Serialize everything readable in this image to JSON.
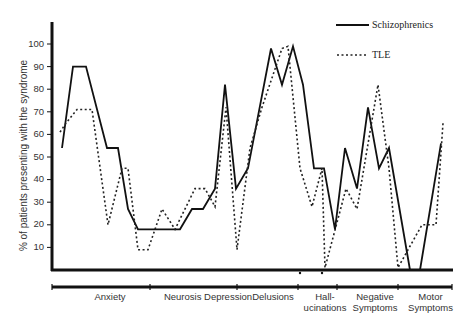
{
  "chart_data": {
    "type": "line",
    "title": "",
    "xlabel": "",
    "ylabel": "% of patients presenting with the syndrome",
    "ylim": [
      0,
      105
    ],
    "yticks": [
      10,
      20,
      30,
      40,
      50,
      60,
      70,
      80,
      90,
      100
    ],
    "grid": false,
    "legend_position": "top-right",
    "categories": [
      "Anxiety",
      "Neurosis Depression",
      "Delusions",
      "Hall-\nucinations",
      "Negative Symptoms",
      "Motor Symptoms"
    ],
    "series": [
      {
        "name": "Schizophrenics",
        "style": "solid",
        "points": [
          [
            62,
            54
          ],
          [
            73,
            90
          ],
          [
            86,
            90
          ],
          [
            107,
            54
          ],
          [
            118,
            54
          ],
          [
            128,
            27
          ],
          [
            138,
            18
          ],
          [
            180,
            18
          ],
          [
            192,
            27
          ],
          [
            203,
            27
          ],
          [
            215,
            36
          ],
          [
            225,
            82
          ],
          [
            236,
            36
          ],
          [
            248,
            45
          ],
          [
            271,
            98
          ],
          [
            282,
            82
          ],
          [
            293,
            99
          ],
          [
            303,
            82
          ],
          [
            314,
            45
          ],
          [
            324,
            45
          ],
          [
            335,
            18
          ],
          [
            345,
            54
          ],
          [
            357,
            36
          ],
          [
            368,
            72
          ],
          [
            379,
            45
          ],
          [
            389,
            54
          ],
          [
            410,
            0
          ],
          [
            420,
            0
          ],
          [
            441,
            56
          ]
        ]
      },
      {
        "name": "TLE",
        "style": "dotted",
        "points": [
          [
            60,
            61
          ],
          [
            66,
            65
          ],
          [
            77,
            71
          ],
          [
            92,
            71
          ],
          [
            108,
            20
          ],
          [
            122,
            45
          ],
          [
            128,
            45
          ],
          [
            138,
            9
          ],
          [
            148,
            9
          ],
          [
            162,
            27
          ],
          [
            175,
            18
          ],
          [
            195,
            36
          ],
          [
            205,
            36
          ],
          [
            215,
            28
          ],
          [
            226,
            72
          ],
          [
            237,
            9
          ],
          [
            250,
            54
          ],
          [
            262,
            72
          ],
          [
            282,
            98
          ],
          [
            288,
            99
          ],
          [
            300,
            45
          ],
          [
            312,
            28
          ],
          [
            322,
            45
          ],
          [
            325,
            1
          ],
          [
            346,
            36
          ],
          [
            357,
            27
          ],
          [
            378,
            82
          ],
          [
            389,
            45
          ],
          [
            398,
            1
          ],
          [
            422,
            20
          ],
          [
            436,
            20
          ],
          [
            443,
            65
          ]
        ]
      }
    ]
  },
  "legend": {
    "schizophrenics": "Schizophrenics",
    "tle": "TLE"
  },
  "axis": {
    "ylabel": "% of patients presenting with the syndrome",
    "ticks": [
      "100",
      "90",
      "80",
      "70",
      "60",
      "50",
      "40",
      "30",
      "20",
      "10"
    ]
  },
  "categories": [
    {
      "line1": "Anxiety",
      "line2": ""
    },
    {
      "line1": "Neurosis Depression",
      "line2": ""
    },
    {
      "line1": "Delusions",
      "line2": ""
    },
    {
      "line1": "Hall-",
      "line2": "ucinations"
    },
    {
      "line1": "Negative",
      "line2": "Symptoms"
    },
    {
      "line1": "Motor",
      "line2": "Symptoms"
    }
  ]
}
